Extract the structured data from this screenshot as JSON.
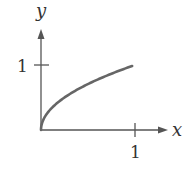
{
  "chart_data": {
    "type": "line",
    "title": "",
    "xlabel": "x",
    "ylabel": "y",
    "xlim": [
      0,
      1.2
    ],
    "ylim": [
      0,
      1.35
    ],
    "x_ticks": [
      {
        "value": 1,
        "label": "1"
      }
    ],
    "y_ticks": [
      {
        "value": 1,
        "label": "1"
      }
    ],
    "grid": false,
    "series": [
      {
        "name": "y = sqrt(x)",
        "function": "sqrt",
        "x": [
          0,
          0.05,
          0.1,
          0.2,
          0.3,
          0.4,
          0.5,
          0.6,
          0.7,
          0.8,
          0.9,
          0.97
        ],
        "y": [
          0,
          0.22,
          0.32,
          0.45,
          0.55,
          0.63,
          0.71,
          0.77,
          0.84,
          0.89,
          0.95,
          0.98
        ]
      }
    ]
  }
}
